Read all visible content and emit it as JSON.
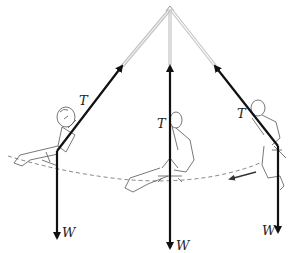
{
  "diagram": {
    "type": "physics-free-body",
    "labels": {
      "tension": "T",
      "weight": "W"
    },
    "positions": [
      {
        "name": "left-extreme",
        "tension_label": "T",
        "weight_label": "W"
      },
      {
        "name": "bottom-center",
        "tension_label": "T",
        "weight_label": "W"
      },
      {
        "name": "right-extreme",
        "tension_label": "T",
        "weight_label": "W"
      }
    ],
    "motion_direction": "leftward along arc",
    "colors": {
      "force_arrow": "#111111",
      "rope_upper": "#bdbdbd",
      "arc": "#555555",
      "figure": "#444444"
    }
  }
}
